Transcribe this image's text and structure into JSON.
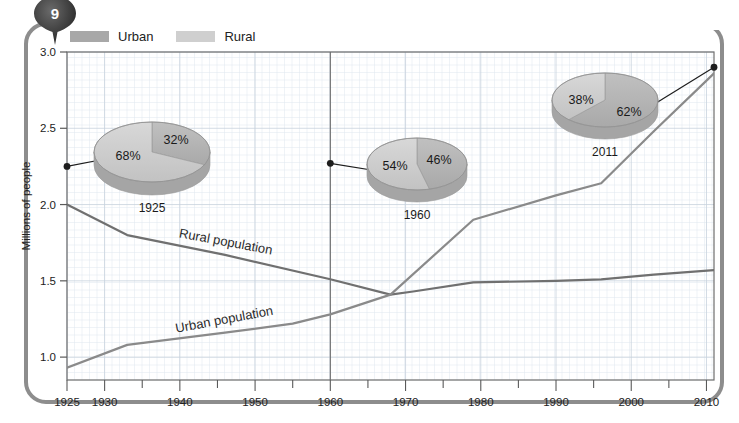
{
  "page": {
    "number": "9",
    "frame_color": "#8d8d8d"
  },
  "legend": {
    "items": [
      {
        "label": "Urban",
        "color": "#a8a8a8"
      },
      {
        "label": "Rural",
        "color": "#cfcfcf"
      }
    ]
  },
  "chart_data": {
    "type": "line",
    "title": "",
    "xlabel": "",
    "ylabel": "Millions of people",
    "xlim": [
      1925,
      2011
    ],
    "ylim": [
      0.85,
      3.0
    ],
    "yticks": [
      "1.0",
      "1.5",
      "2.0",
      "2.5",
      "3.0"
    ],
    "ytick_values": [
      1.0,
      1.5,
      2.0,
      2.5,
      3.0
    ],
    "xticks": [
      "1925",
      "1930",
      "1940",
      "1950",
      "1960",
      "1970",
      "1980",
      "1990",
      "2000",
      "2010"
    ],
    "xtick_values": [
      1925,
      1930,
      1940,
      1950,
      1960,
      1970,
      1980,
      1990,
      2000,
      2010
    ],
    "grid": true,
    "legend_position": "top-left",
    "series": [
      {
        "name": "Rural population",
        "label": "Rural population",
        "color": "#707070",
        "x": [
          1925,
          1933,
          1946,
          1960,
          1968,
          1971,
          1979,
          1990,
          1996,
          2003,
          2011
        ],
        "values": [
          2.0,
          1.8,
          1.67,
          1.51,
          1.41,
          1.43,
          1.49,
          1.5,
          1.51,
          1.54,
          1.57
        ]
      },
      {
        "name": "Urban population",
        "label": "Urban population",
        "color": "#8a8a8a",
        "x": [
          1925,
          1933,
          1946,
          1955,
          1960,
          1968,
          1979,
          1990,
          1996,
          2003,
          2011
        ],
        "values": [
          0.93,
          1.08,
          1.16,
          1.22,
          1.28,
          1.41,
          1.9,
          2.06,
          2.14,
          2.48,
          2.86
        ]
      }
    ],
    "pies": [
      {
        "year": "1925",
        "anchor_x": 1925,
        "anchor_y": 2.25,
        "slices": [
          {
            "label": "68%",
            "value": 68,
            "series": "Rural",
            "color": "#c9c9c9"
          },
          {
            "label": "32%",
            "value": 32,
            "series": "Urban",
            "color": "#b0b0b0"
          }
        ]
      },
      {
        "year": "1960",
        "anchor_x": 1960,
        "anchor_y": 2.27,
        "slices": [
          {
            "label": "54%",
            "value": 54,
            "series": "Rural",
            "color": "#c9c9c9"
          },
          {
            "label": "46%",
            "value": 46,
            "series": "Urban",
            "color": "#b0b0b0"
          }
        ]
      },
      {
        "year": "2011",
        "anchor_x": 2011,
        "anchor_y": 2.9,
        "slices": [
          {
            "label": "38%",
            "value": 38,
            "series": "Rural",
            "color": "#c9c9c9"
          },
          {
            "label": "62%",
            "value": 62,
            "series": "Urban",
            "color": "#b0b0b0"
          }
        ]
      }
    ],
    "marker_line_year": 1960
  }
}
